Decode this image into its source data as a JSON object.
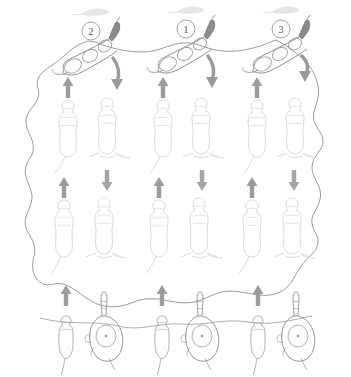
{
  "figure": {
    "background_color": "#ffffff",
    "width": 351,
    "height": 377,
    "boundary": {
      "name": "enclosure-outline",
      "stroke_color": "#8f8f8f",
      "stroke_width": 0.9,
      "description": "irregular wavy closed contour enclosing the whole scene"
    },
    "step_labels": [
      {
        "id": "label-2",
        "text": "2",
        "cx": 91,
        "cy": 31,
        "r": 9
      },
      {
        "id": "label-1",
        "text": "1",
        "cx": 186,
        "cy": 29,
        "r": 9
      },
      {
        "id": "label-3",
        "text": "3",
        "cx": 281,
        "cy": 29,
        "r": 9
      }
    ],
    "columns_x": [
      68,
      107,
      162,
      200,
      257,
      295
    ],
    "colors": {
      "outline_dark": "#7d7d7d",
      "outline_mid": "#b5b5b5",
      "outline_faint": "#dcdcdc",
      "arrow_gray": "#9a9a9a",
      "arrow_dark": "#8a8a8a",
      "wisp_gray": "#e0e0e0"
    },
    "rows": [
      {
        "name": "top-row-active",
        "y": 55,
        "description": "three prominent rodents in lateral stretched posture, each beside a numbered marker"
      },
      {
        "name": "wisp-row",
        "y": 12,
        "description": "three faint elongated smudge shapes above the numbered markers"
      },
      {
        "name": "middle-row-1",
        "y": 130,
        "description": "six faint dorsal-view rodent outlines"
      },
      {
        "name": "middle-row-2",
        "y": 228,
        "description": "six faint dorsal-view rodent outlines"
      },
      {
        "name": "bottom-row",
        "y": 335,
        "description": "three pairs of darker rodent outlines, each pair a small rodent and a larger rodent with elongated snout"
      }
    ],
    "arrows": [
      {
        "name": "arrow-up",
        "x": 68,
        "y": 88,
        "dir": "up",
        "style": "straight"
      },
      {
        "name": "arrow-down-curved",
        "x": 110,
        "y": 70,
        "dir": "down",
        "style": "curved"
      },
      {
        "name": "arrow-up",
        "x": 162,
        "y": 88,
        "dir": "up",
        "style": "straight"
      },
      {
        "name": "arrow-down-curved",
        "x": 205,
        "y": 70,
        "dir": "down",
        "style": "curved"
      },
      {
        "name": "arrow-up",
        "x": 257,
        "y": 88,
        "dir": "up",
        "style": "straight"
      },
      {
        "name": "arrow-down-curved",
        "x": 298,
        "y": 70,
        "dir": "down",
        "style": "curved"
      },
      {
        "name": "arrow-up",
        "x": 62,
        "y": 188,
        "dir": "up",
        "style": "straight"
      },
      {
        "name": "arrow-down",
        "x": 106,
        "y": 177,
        "dir": "down",
        "style": "straight"
      },
      {
        "name": "arrow-up",
        "x": 158,
        "y": 188,
        "dir": "up",
        "style": "straight"
      },
      {
        "name": "arrow-down",
        "x": 202,
        "y": 177,
        "dir": "down",
        "style": "straight"
      },
      {
        "name": "arrow-up",
        "x": 250,
        "y": 188,
        "dir": "up",
        "style": "straight"
      },
      {
        "name": "arrow-down",
        "x": 293,
        "y": 177,
        "dir": "down",
        "style": "straight"
      },
      {
        "name": "arrow-up",
        "x": 66,
        "y": 295,
        "dir": "up",
        "style": "straight"
      },
      {
        "name": "arrow-up",
        "x": 162,
        "y": 295,
        "dir": "up",
        "style": "straight"
      },
      {
        "name": "arrow-up",
        "x": 258,
        "y": 295,
        "dir": "up",
        "style": "straight"
      }
    ]
  }
}
